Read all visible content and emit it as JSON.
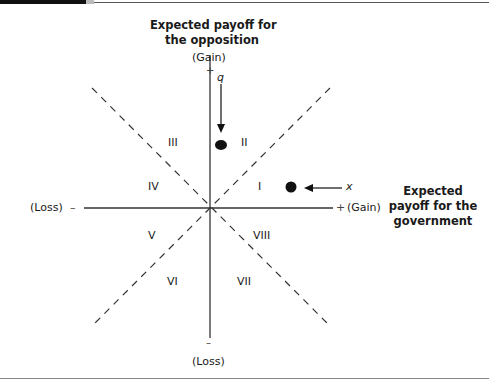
{
  "y_axis": {
    "title_line1": "Expected payoff for",
    "title_line2": "the opposition",
    "top_label": "(Gain)",
    "top_sign": "+",
    "bottom_sign": "–",
    "bottom_label": "(Loss)"
  },
  "x_axis": {
    "left_label": "(Loss)",
    "left_sign": "–",
    "right_sign": "+",
    "right_label": "(Gain)",
    "title_line1": "Expected",
    "title_line2": "payoff for the",
    "title_line3": "government"
  },
  "regions": [
    "I",
    "II",
    "III",
    "IV",
    "V",
    "VI",
    "VII",
    "VIII"
  ],
  "points": {
    "q": {
      "label": "q"
    },
    "x": {
      "label": "x"
    }
  },
  "colors": {
    "axis": "#333333",
    "dash": "#333333",
    "point": "#111111"
  }
}
